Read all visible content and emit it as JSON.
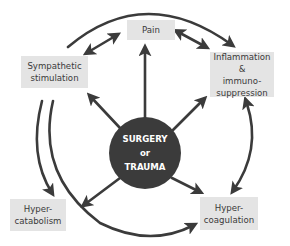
{
  "diagram": {
    "center": {
      "lines": [
        "SURGERY",
        "or",
        "TRAUMA"
      ]
    },
    "nodes": [
      {
        "id": "pain",
        "lines": [
          "Pain"
        ]
      },
      {
        "id": "sympathetic",
        "lines": [
          "Sympathetic",
          "stimulation"
        ]
      },
      {
        "id": "inflammation",
        "lines": [
          "Inflammation &",
          "immuno-",
          "suppression"
        ]
      },
      {
        "id": "hypercatabolism",
        "lines": [
          "Hyper-",
          "catabolism"
        ]
      },
      {
        "id": "hypercoagulation",
        "lines": [
          "Hyper-",
          "coagulation"
        ]
      }
    ],
    "edges": [
      {
        "from": "center",
        "to": "pain",
        "type": "arrow"
      },
      {
        "from": "center",
        "to": "sympathetic",
        "type": "arrow"
      },
      {
        "from": "center",
        "to": "inflammation",
        "type": "arrow"
      },
      {
        "from": "center",
        "to": "hypercatabolism",
        "type": "arrow"
      },
      {
        "from": "center",
        "to": "hypercoagulation",
        "type": "arrow"
      },
      {
        "from": "sympathetic",
        "to": "pain",
        "type": "double-arrow"
      },
      {
        "from": "pain",
        "to": "inflammation",
        "type": "double-arrow"
      },
      {
        "from": "sympathetic",
        "to": "inflammation",
        "type": "curved-arrow"
      },
      {
        "from": "sympathetic",
        "to": "hypercatabolism",
        "type": "curved-arrow"
      },
      {
        "from": "sympathetic",
        "to": "hypercoagulation",
        "type": "curved-arrow"
      },
      {
        "from": "inflammation",
        "to": "hypercoagulation",
        "type": "curved-double-arrow"
      }
    ],
    "colors": {
      "box_fill": "#e4e4e4",
      "hub_fill": "#3b3b3b",
      "arrow": "#3b3b3b",
      "text": "#3a3a3a"
    }
  }
}
